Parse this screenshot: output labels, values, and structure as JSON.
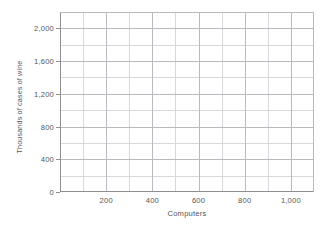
{
  "chart_data": {
    "type": "scatter",
    "title": "",
    "subtitle": "",
    "xlabel": "Computers",
    "ylabel": "Thousands of cases of wine",
    "xlim": [
      0,
      1100
    ],
    "ylim": [
      0,
      2200
    ],
    "x_ticks": [
      200,
      400,
      600,
      800,
      1000
    ],
    "x_tick_labels": [
      "200",
      "400",
      "600",
      "800",
      "1,000"
    ],
    "y_ticks": [
      0,
      400,
      800,
      1200,
      1600,
      2000
    ],
    "y_tick_labels": [
      "0",
      "400",
      "800",
      "1,200",
      "1,600",
      "2,000"
    ],
    "x_major_step": 200,
    "x_minor_step": 100,
    "y_major_step": 400,
    "y_minor_step": 200,
    "grid": true,
    "grid_color": "#b9b9bf",
    "minor_grid_color": "#d8d8dd",
    "axis_color": "#8d8d93",
    "background": "#ffffff",
    "legend": [],
    "legend_position": "none",
    "annotations": [],
    "series": [],
    "x": [],
    "values": [],
    "note": "empty plotting grid, no data plotted"
  }
}
